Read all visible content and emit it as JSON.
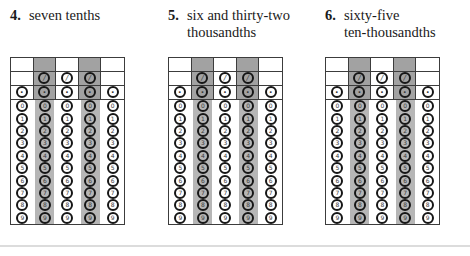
{
  "questions": [
    {
      "number": "4.",
      "lines": [
        "seven tenths"
      ]
    },
    {
      "number": "5.",
      "lines": [
        "six and thirty-two",
        "thousandths"
      ]
    },
    {
      "number": "6.",
      "lines": [
        "sixty-five",
        "ten-thousandths"
      ]
    }
  ],
  "answer_grid": {
    "columns": 5,
    "shaded_columns": [
      2,
      4
    ],
    "fraction_slash_columns": [
      2,
      3,
      4
    ],
    "fraction_slash_symbol": "/",
    "decimal_point_symbol": ".",
    "digits": [
      "0",
      "1",
      "2",
      "3",
      "4",
      "5",
      "6",
      "7",
      "8",
      "9"
    ],
    "filled_bubbles": [],
    "colors": {
      "shaded_header": "#a2a2a2",
      "shaded_stripe": "#b6b6b6",
      "grid_line": "#3c3c3c",
      "bubble_ring": "#161616",
      "bubble_text": "#3a3a3a"
    }
  },
  "bottom_rule_color": "#dcdcdc",
  "layout_lefts_px": [
    10,
    168,
    325
  ]
}
